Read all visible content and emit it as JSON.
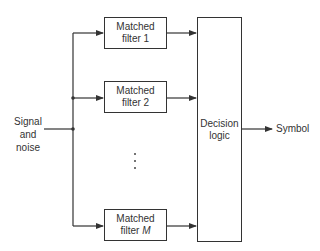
{
  "diagram": {
    "type": "block-diagram",
    "input_label": {
      "line1": "Signal",
      "line2": "and",
      "line3": "noise"
    },
    "filters": [
      {
        "line1": "Matched",
        "line2_prefix": "filter ",
        "line2_index": "1"
      },
      {
        "line1": "Matched",
        "line2_prefix": "filter ",
        "line2_index": "2"
      },
      {
        "line1": "Matched",
        "line2_prefix": "filter ",
        "line2_index": "M"
      }
    ],
    "ellipsis": "⋮",
    "decision": {
      "line1": "Decision",
      "line2": "logic"
    },
    "output_label": "Symbol",
    "colors": {
      "line": "#333333",
      "background": "#ffffff"
    }
  }
}
